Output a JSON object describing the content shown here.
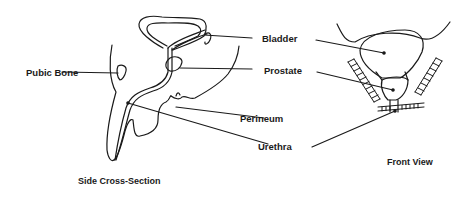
{
  "diagram": {
    "labels": {
      "pubic_bone": "Pubic Bone",
      "bladder": "Bladder",
      "prostate": "Prostate",
      "perineum": "Perineum",
      "urethra": "Urethra"
    },
    "captions": {
      "side": "Side Cross-Section",
      "front": "Front View"
    },
    "colors": {
      "line": "#1a1a1a",
      "background": "#ffffff"
    }
  }
}
